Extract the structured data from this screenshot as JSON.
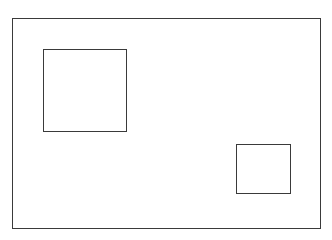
{
  "diagram": {
    "stroke_color": "#3a3a3a",
    "background_color": "#ffffff",
    "shapes": [
      {
        "id": "outer",
        "type": "rectangle",
        "label": ""
      },
      {
        "id": "large-square",
        "type": "rectangle",
        "label": ""
      },
      {
        "id": "small-square",
        "type": "rectangle",
        "label": ""
      }
    ]
  }
}
